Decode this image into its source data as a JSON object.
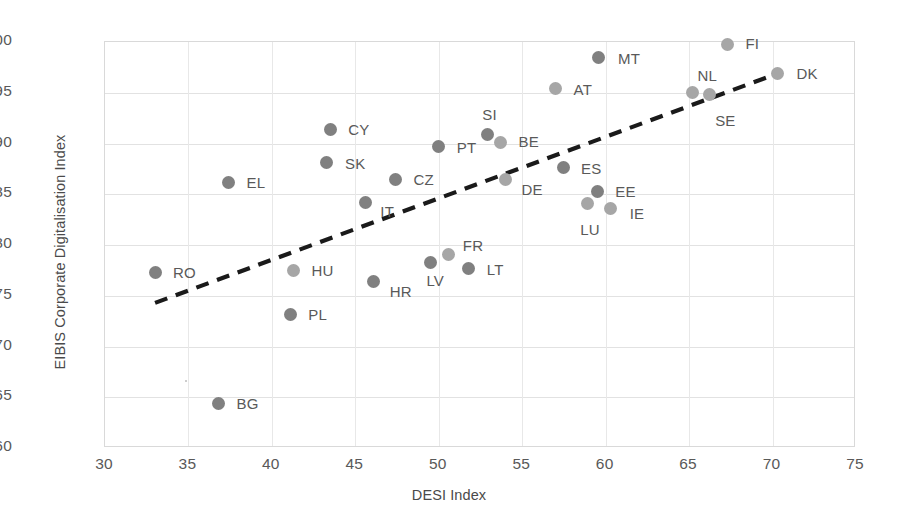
{
  "chart_data": {
    "type": "scatter",
    "title": "",
    "xlabel": "DESI Index",
    "ylabel": "EIBIS Corporate Digitalisation Index",
    "xlim": [
      30,
      75
    ],
    "ylim": [
      60,
      100
    ],
    "xticks": [
      30,
      35,
      40,
      45,
      50,
      55,
      60,
      65,
      70,
      75
    ],
    "yticks": [
      60,
      65,
      70,
      75,
      80,
      85,
      90,
      95,
      100
    ],
    "grid": true,
    "legend": "none",
    "colors": {
      "marker_dark": "#808080",
      "marker_light": "#a6a6a6",
      "trendline": "#1a1a1a",
      "gridline": "#e2e2e2",
      "tick_text": "#595959",
      "axis_title": "#4a4a4a"
    },
    "trendline": {
      "style": "dashed",
      "x_start": 33.0,
      "y_start": 74.3,
      "x_end": 70.3,
      "y_end": 96.9
    },
    "points": [
      {
        "label": "RO",
        "x": 33.0,
        "y": 77.3,
        "shade": "dark",
        "label_dx": 18,
        "label_dy": -8
      },
      {
        "label": "BG",
        "x": 36.8,
        "y": 64.4,
        "shade": "dark",
        "label_dx": 18,
        "label_dy": -8
      },
      {
        "label": "EL",
        "x": 37.4,
        "y": 86.2,
        "shade": "dark",
        "label_dx": 18,
        "label_dy": -8
      },
      {
        "label": "HU",
        "x": 41.3,
        "y": 77.5,
        "shade": "light",
        "label_dx": 18,
        "label_dy": -8
      },
      {
        "label": "PL",
        "x": 41.1,
        "y": 73.2,
        "shade": "dark",
        "label_dx": 18,
        "label_dy": -8
      },
      {
        "label": "CY",
        "x": 43.5,
        "y": 91.4,
        "shade": "dark",
        "label_dx": 18,
        "label_dy": -8
      },
      {
        "label": "SK",
        "x": 43.3,
        "y": 88.1,
        "shade": "dark",
        "label_dx": 18,
        "label_dy": -8
      },
      {
        "label": "IT",
        "x": 45.6,
        "y": 84.2,
        "shade": "dark",
        "label_dx": 15,
        "label_dy": 1
      },
      {
        "label": "HR",
        "x": 46.1,
        "y": 76.4,
        "shade": "dark",
        "label_dx": 16,
        "label_dy": 1
      },
      {
        "label": "CZ",
        "x": 47.4,
        "y": 86.5,
        "shade": "dark",
        "label_dx": 18,
        "label_dy": -8
      },
      {
        "label": "LV",
        "x": 49.5,
        "y": 78.3,
        "shade": "dark",
        "label_dx": -4,
        "label_dy": 10
      },
      {
        "label": "PT",
        "x": 50.0,
        "y": 89.7,
        "shade": "dark",
        "label_dx": 18,
        "label_dy": -8
      },
      {
        "label": "FR",
        "x": 50.6,
        "y": 79.1,
        "shade": "light",
        "label_dx": 14,
        "label_dy": -17
      },
      {
        "label": "LT",
        "x": 51.8,
        "y": 77.7,
        "shade": "dark",
        "label_dx": 18,
        "label_dy": -7
      },
      {
        "label": "SI",
        "x": 52.9,
        "y": 90.9,
        "shade": "dark",
        "label_dx": -5,
        "label_dy": -28
      },
      {
        "label": "BE",
        "x": 53.7,
        "y": 90.1,
        "shade": "light",
        "label_dx": 18,
        "label_dy": -9
      },
      {
        "label": "DE",
        "x": 54.0,
        "y": 86.5,
        "shade": "light",
        "label_dx": 16,
        "label_dy": 2
      },
      {
        "label": "AT",
        "x": 57.0,
        "y": 95.4,
        "shade": "light",
        "label_dx": 18,
        "label_dy": -8
      },
      {
        "label": "ES",
        "x": 57.5,
        "y": 87.6,
        "shade": "dark",
        "label_dx": 17,
        "label_dy": -8
      },
      {
        "label": "LU",
        "x": 58.9,
        "y": 84.1,
        "shade": "light",
        "label_dx": -7,
        "label_dy": 18
      },
      {
        "label": "EE",
        "x": 59.5,
        "y": 85.3,
        "shade": "dark",
        "label_dx": 18,
        "label_dy": -8
      },
      {
        "label": "MT",
        "x": 59.6,
        "y": 98.5,
        "shade": "dark",
        "label_dx": 19,
        "label_dy": -7
      },
      {
        "label": "IE",
        "x": 60.3,
        "y": 83.6,
        "shade": "light",
        "label_dx": 19,
        "label_dy": -3
      },
      {
        "label": "NL",
        "x": 65.2,
        "y": 95.0,
        "shade": "light",
        "label_dx": 5,
        "label_dy": -26
      },
      {
        "label": "SE",
        "x": 66.2,
        "y": 94.8,
        "shade": "light",
        "label_dx": 6,
        "label_dy": 17
      },
      {
        "label": "FI",
        "x": 67.3,
        "y": 99.8,
        "shade": "light",
        "label_dx": 18,
        "label_dy": -9
      },
      {
        "label": "DK",
        "x": 70.3,
        "y": 96.9,
        "shade": "light",
        "label_dx": 19,
        "label_dy": -8
      }
    ]
  }
}
